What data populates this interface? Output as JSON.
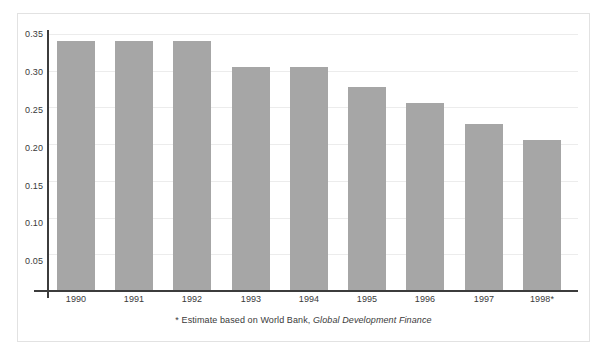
{
  "chart_data": {
    "type": "bar",
    "title": "",
    "subtitle": "",
    "xlabel": "",
    "ylabel": "",
    "categories": [
      "1990",
      "1991",
      "1992",
      "1993",
      "1994",
      "1995",
      "1996",
      "1997",
      "1998*"
    ],
    "values": [
      0.34,
      0.34,
      0.34,
      0.305,
      0.305,
      0.278,
      0.256,
      0.227,
      0.205
    ],
    "series": [
      {
        "name": "",
        "values": [
          0.34,
          0.34,
          0.34,
          0.305,
          0.305,
          0.278,
          0.256,
          0.227,
          0.205
        ]
      }
    ],
    "ylim": [
      0,
      0.355
    ],
    "yticks": [
      0.05,
      0.1,
      0.15,
      0.2,
      0.25,
      0.3,
      0.35
    ],
    "ytick_labels": [
      "0.05",
      "0.10",
      "0.15",
      "0.20",
      "0.25",
      "0.30",
      "0.35"
    ],
    "grid": true,
    "grid_axis": "y",
    "legend": false,
    "legend_position": "none",
    "bar_color": "#a6a6a6",
    "gridline_color": "#ececec",
    "axis_color": "#3c3c3c",
    "frame_color": "#e2e2e2",
    "text_color": "#3a3a3a",
    "background": "#ffffff",
    "annotations": [
      {
        "name": "footnote",
        "text_plain": "* Estimate based on World Bank, Global Development Finance",
        "text_prefix": "* Estimate based on World Bank, ",
        "text_italic": "Global Development Finance",
        "position": "below-axis-center"
      }
    ]
  }
}
